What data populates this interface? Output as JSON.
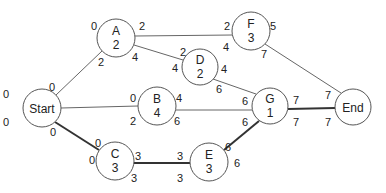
{
  "diagram": {
    "title": "",
    "colors": {
      "node_stroke": "#555555",
      "edge": "#666666",
      "critical_edge": "#333333",
      "text": "#222222"
    },
    "nodes": {
      "start": {
        "name": "Start",
        "duration": "",
        "x": 42,
        "y": 108,
        "r": 19
      },
      "a": {
        "name": "A",
        "duration": "2",
        "x": 116,
        "y": 38,
        "r": 19
      },
      "f": {
        "name": "F",
        "duration": "3",
        "x": 251,
        "y": 31,
        "r": 19
      },
      "d": {
        "name": "D",
        "duration": "2",
        "x": 200,
        "y": 67,
        "r": 18
      },
      "b": {
        "name": "B",
        "duration": "4",
        "x": 157,
        "y": 106,
        "r": 19
      },
      "g": {
        "name": "G",
        "duration": "1",
        "x": 270,
        "y": 106,
        "r": 18
      },
      "c": {
        "name": "C",
        "duration": "3",
        "x": 115,
        "y": 161,
        "r": 19
      },
      "e": {
        "name": "E",
        "duration": "3",
        "x": 209,
        "y": 162,
        "r": 19
      },
      "end": {
        "name": "End",
        "duration": "",
        "x": 353,
        "y": 107,
        "r": 18
      }
    },
    "edges": [
      {
        "from": "Start",
        "to": "A",
        "critical": false
      },
      {
        "from": "Start",
        "to": "B",
        "critical": false
      },
      {
        "from": "Start",
        "to": "C",
        "critical": true
      },
      {
        "from": "A",
        "to": "F",
        "critical": false
      },
      {
        "from": "A",
        "to": "D",
        "critical": false
      },
      {
        "from": "D",
        "to": "G",
        "critical": false
      },
      {
        "from": "B",
        "to": "G",
        "critical": false
      },
      {
        "from": "C",
        "to": "E",
        "critical": true
      },
      {
        "from": "E",
        "to": "G",
        "critical": true
      },
      {
        "from": "F",
        "to": "End",
        "critical": false
      },
      {
        "from": "G",
        "to": "End",
        "critical": true
      }
    ],
    "schedule": {
      "start": {
        "es": "0",
        "ls": "0"
      },
      "a": {
        "es": "0",
        "ef": "2",
        "ls": "2",
        "lf": "4"
      },
      "f": {
        "es": "2",
        "ef": "5",
        "ls": "4",
        "lf": "7"
      },
      "d": {
        "es": "2",
        "ef": "4",
        "ls": "4",
        "lf": "6"
      },
      "b": {
        "es": "0",
        "ef": "4",
        "ls": "2",
        "lf": "6"
      },
      "g": {
        "es": "6",
        "ef": "7",
        "ls": "6",
        "lf": "7"
      },
      "c": {
        "es": "0",
        "ef": "3",
        "ls": "0",
        "lf": "3"
      },
      "e": {
        "es": "3",
        "ef": "6",
        "ls": "3",
        "lf": "6"
      },
      "end": {
        "es": "7",
        "ls": "7"
      }
    },
    "edge_labels": {
      "start_a_to": "0",
      "a_in_ls": "2",
      "c_in_es": "0",
      "start_c_ls": "0"
    }
  }
}
